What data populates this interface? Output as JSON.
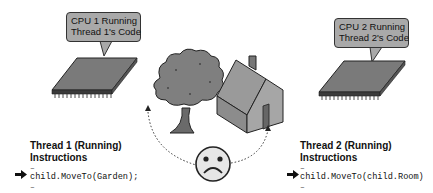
{
  "cpus": [
    {
      "id": "cpu1",
      "bubble_line1": "CPU 1 Running",
      "bubble_line2": "Thread 1's Code"
    },
    {
      "id": "cpu2",
      "bubble_line1": "CPU 2 Running",
      "bubble_line2": "Thread 2's Code"
    }
  ],
  "scene": {
    "objects": [
      "tree-icon",
      "house-icon",
      "sad-face-icon"
    ],
    "connector": "dotted arc from tree to house through sad face"
  },
  "threads": [
    {
      "title_line1": "Thread 1 (Running)",
      "title_line2": "Instructions",
      "before": "–",
      "current_instruction": "child.MoveTo(Garden);",
      "after": "–"
    },
    {
      "title_line1": "Thread 2 (Running)",
      "title_line2": "Instructions",
      "before": "–",
      "current_instruction": "child.MoveTo(child.Room)",
      "after": "–"
    }
  ],
  "colors": {
    "bubble_fill": "#a9a9a9",
    "chip_top": "#7a7a7a",
    "tree_fill": "#7f7f7f",
    "house_fill": "#9a9a9a",
    "face_fill": "#e6e6e6"
  }
}
